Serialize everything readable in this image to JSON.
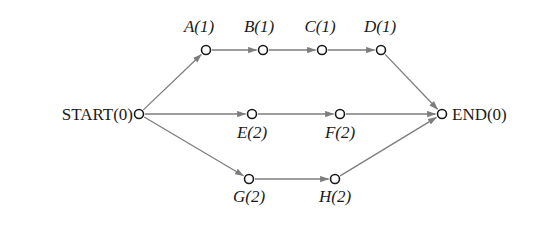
{
  "diagram": {
    "type": "directed-acyclic-graph",
    "background_color": "#ffffff",
    "edge_color": "#7d7d7d",
    "node_stroke_color": "#1a1a1a",
    "node_fill_color": "#ffffff",
    "text_color": "#1a1a1a",
    "nodes": [
      {
        "id": "START",
        "label": "START(0)",
        "name": "START",
        "duration": "0",
        "x": 139,
        "y": 114,
        "r": 4.5,
        "label_x": 133,
        "label_y": 106,
        "label_align": "right",
        "label_style": "upright"
      },
      {
        "id": "A",
        "label": "A(1)",
        "name": "A",
        "duration": "1",
        "x": 206,
        "y": 50,
        "r": 4.5,
        "label_x": 199,
        "label_y": 18,
        "label_align": "center",
        "label_style": "italic"
      },
      {
        "id": "B",
        "label": "B(1)",
        "name": "B",
        "duration": "1",
        "x": 263,
        "y": 50,
        "r": 4.5,
        "label_x": 259,
        "label_y": 18,
        "label_align": "center",
        "label_style": "italic"
      },
      {
        "id": "C",
        "label": "C(1)",
        "name": "C",
        "duration": "1",
        "x": 322,
        "y": 50,
        "r": 4.5,
        "label_x": 320,
        "label_y": 18,
        "label_align": "center",
        "label_style": "italic"
      },
      {
        "id": "D",
        "label": "D(1)",
        "name": "D",
        "duration": "1",
        "x": 381,
        "y": 50,
        "r": 4.5,
        "label_x": 380,
        "label_y": 18,
        "label_align": "center",
        "label_style": "italic"
      },
      {
        "id": "E",
        "label": "E(2)",
        "name": "E",
        "duration": "2",
        "x": 252,
        "y": 114,
        "r": 4.5,
        "label_x": 252,
        "label_y": 124,
        "label_align": "center",
        "label_style": "italic"
      },
      {
        "id": "F",
        "label": "F(2)",
        "name": "F",
        "duration": "2",
        "x": 340,
        "y": 114,
        "r": 4.5,
        "label_x": 340,
        "label_y": 124,
        "label_align": "center",
        "label_style": "italic"
      },
      {
        "id": "G",
        "label": "G(2)",
        "name": "G",
        "duration": "2",
        "x": 249,
        "y": 179,
        "r": 4.5,
        "label_x": 249,
        "label_y": 188,
        "label_align": "center",
        "label_style": "italic"
      },
      {
        "id": "H",
        "label": "H(2)",
        "name": "H",
        "duration": "2",
        "x": 335,
        "y": 179,
        "r": 4.5,
        "label_x": 335,
        "label_y": 188,
        "label_align": "center",
        "label_style": "italic"
      },
      {
        "id": "END",
        "label": "END(0)",
        "name": "END",
        "duration": "0",
        "x": 442,
        "y": 114,
        "r": 4.5,
        "label_x": 452,
        "label_y": 106,
        "label_align": "left",
        "label_style": "upright"
      }
    ],
    "edges": [
      {
        "from": "START",
        "to": "A"
      },
      {
        "from": "A",
        "to": "B"
      },
      {
        "from": "B",
        "to": "C"
      },
      {
        "from": "C",
        "to": "D"
      },
      {
        "from": "D",
        "to": "END"
      },
      {
        "from": "START",
        "to": "E"
      },
      {
        "from": "E",
        "to": "F"
      },
      {
        "from": "F",
        "to": "END"
      },
      {
        "from": "START",
        "to": "G"
      },
      {
        "from": "G",
        "to": "H"
      },
      {
        "from": "H",
        "to": "END"
      }
    ]
  }
}
